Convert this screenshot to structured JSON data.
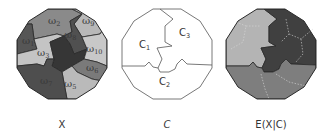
{
  "panels": [
    {
      "id": "X",
      "caption": "X",
      "regions": [
        {
          "name": "w1",
          "symbol": "ω",
          "sub": "1"
        },
        {
          "name": "w2",
          "symbol": "ω",
          "sub": "2"
        },
        {
          "name": "w3",
          "symbol": "ω",
          "sub": "3"
        },
        {
          "name": "w4",
          "symbol": "ω",
          "sub": "4"
        },
        {
          "name": "w5",
          "symbol": "ω",
          "sub": "5"
        },
        {
          "name": "w6",
          "symbol": "ω",
          "sub": "6"
        },
        {
          "name": "w7",
          "symbol": "ω",
          "sub": "7"
        },
        {
          "name": "w8",
          "symbol": "ω",
          "sub": "8"
        },
        {
          "name": "w9",
          "symbol": "ω",
          "sub": "9"
        },
        {
          "name": "w10",
          "symbol": "ω",
          "sub": "10"
        }
      ]
    },
    {
      "id": "C",
      "caption": "C",
      "regions": [
        {
          "name": "C1",
          "symbol": "C",
          "sub": "1"
        },
        {
          "name": "C2",
          "symbol": "C",
          "sub": "2"
        },
        {
          "name": "C3",
          "symbol": "C",
          "sub": "3"
        }
      ]
    },
    {
      "id": "EXC",
      "caption": "E(X|C)"
    }
  ],
  "colors": {
    "light": "#bdbdbd",
    "mid": "#8a8a8a",
    "midlight": "#9e9e9e",
    "dark": "#4a4a4a",
    "darker": "#3a3a3a",
    "outline": "#2a2a2a",
    "exc_c1": "#b4b4b4",
    "exc_c2": "#7e7e7e",
    "exc_c3": "#404040"
  }
}
